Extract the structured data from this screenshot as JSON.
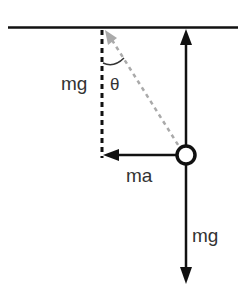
{
  "diagram": {
    "type": "free-body diagram of pendulum / hanging mass",
    "colors": {
      "background": "#ffffff",
      "primary": "#111111",
      "string_dashed": "#aaaaaa",
      "label": "#333333"
    },
    "labels": {
      "vertical_component": "mg",
      "angle": "θ",
      "horizontal_force": "ma",
      "weight_force": "mg"
    },
    "elements": {
      "ceiling": "horizontal support line",
      "tension_arrow": "vertical arrow up from mass to ceiling",
      "string": "gray dashed line from ceiling to mass at angle θ",
      "vertical_dashed": "black dashed vertical reference line",
      "mass": "circle (bob)",
      "ma_arrow": "horizontal arrow pointing left",
      "mg_arrow": "vertical arrow pointing down"
    }
  }
}
